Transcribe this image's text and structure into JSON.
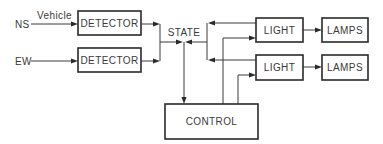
{
  "diagram": {
    "title": "",
    "inputs": [
      {
        "id": "ns",
        "label": "NS",
        "annotation": "Vehicle"
      },
      {
        "id": "ew",
        "label": "EW"
      }
    ],
    "blocks": {
      "detector_ns": "DETECTOR",
      "detector_ew": "DETECTOR",
      "state": "STATE",
      "light_1": "LIGHT",
      "light_2": "LIGHT",
      "lamps_1": "LAMPS",
      "lamps_2": "LAMPS",
      "control": "CONTROL"
    },
    "edges": [
      {
        "from": "NS",
        "to": "DETECTOR (NS)",
        "label": "Vehicle"
      },
      {
        "from": "EW",
        "to": "DETECTOR (EW)"
      },
      {
        "from": "DETECTOR (NS)",
        "to": "STATE"
      },
      {
        "from": "DETECTOR (EW)",
        "to": "STATE"
      },
      {
        "from": "LIGHT (1)",
        "to": "STATE"
      },
      {
        "from": "LIGHT (2)",
        "to": "STATE"
      },
      {
        "from": "STATE",
        "to": "CONTROL"
      },
      {
        "from": "CONTROL",
        "to": "LIGHT (1)"
      },
      {
        "from": "CONTROL",
        "to": "LIGHT (2)"
      },
      {
        "from": "LIGHT (1)",
        "to": "LAMPS (1)"
      },
      {
        "from": "LIGHT (2)",
        "to": "LAMPS (2)"
      }
    ],
    "colors": {
      "line": "#2a2a2a",
      "background": "#ffffff"
    }
  }
}
